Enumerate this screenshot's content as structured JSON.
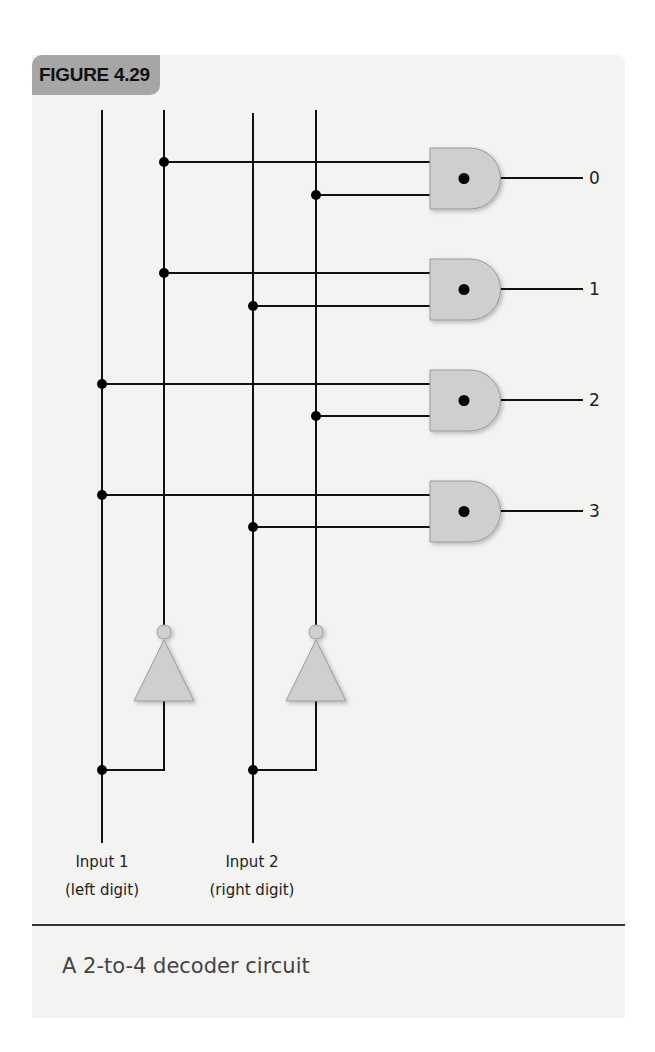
{
  "figure": {
    "tag": "FIGURE 4.29",
    "caption": "A 2-to-4 decoder circuit"
  },
  "inputs": [
    {
      "label": "Input 1",
      "sublabel": "(left digit)"
    },
    {
      "label": "Input 2",
      "sublabel": "(right digit)"
    }
  ],
  "outputs": [
    "0",
    "1",
    "2",
    "3"
  ],
  "colors": {
    "panel_bg": "#f3f3f2",
    "tab_bg": "#a6a6a6",
    "gate_fill": "#cfcfcf",
    "wire": "#111111"
  },
  "gates": [
    {
      "type": "AND",
      "output": "0",
      "inputs": [
        "NOT Input 1",
        "NOT Input 2"
      ]
    },
    {
      "type": "AND",
      "output": "1",
      "inputs": [
        "NOT Input 1",
        "Input 2"
      ]
    },
    {
      "type": "AND",
      "output": "2",
      "inputs": [
        "Input 1",
        "NOT Input 2"
      ]
    },
    {
      "type": "AND",
      "output": "3",
      "inputs": [
        "Input 1",
        "Input 2"
      ]
    }
  ],
  "inverters": [
    {
      "type": "NOT",
      "input": "Input 1"
    },
    {
      "type": "NOT",
      "input": "Input 2"
    }
  ]
}
